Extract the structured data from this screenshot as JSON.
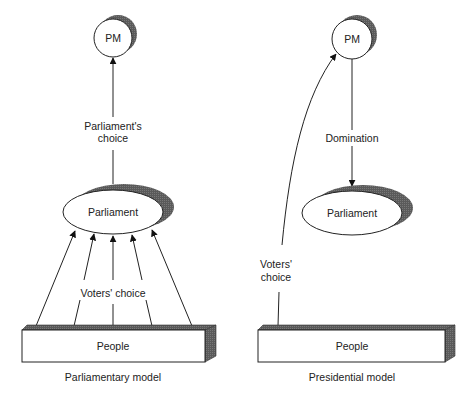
{
  "diagram": {
    "left": {
      "caption": "Parliamentary model",
      "pm_label": "PM",
      "parliament_label": "Parliament",
      "people_label": "People",
      "pm_arrow_label_line1": "Parliament's",
      "pm_arrow_label_line2": "choice",
      "voters_label": "Voters' choice"
    },
    "right": {
      "caption": "Presidential model",
      "pm_label": "PM",
      "parliament_label": "Parliament",
      "people_label": "People",
      "domination_label": "Domination",
      "voters_label_line1": "Voters'",
      "voters_label_line2": "choice"
    },
    "colors": {
      "line": "#222222",
      "shadow": "#555555",
      "fill": "#ffffff"
    }
  }
}
